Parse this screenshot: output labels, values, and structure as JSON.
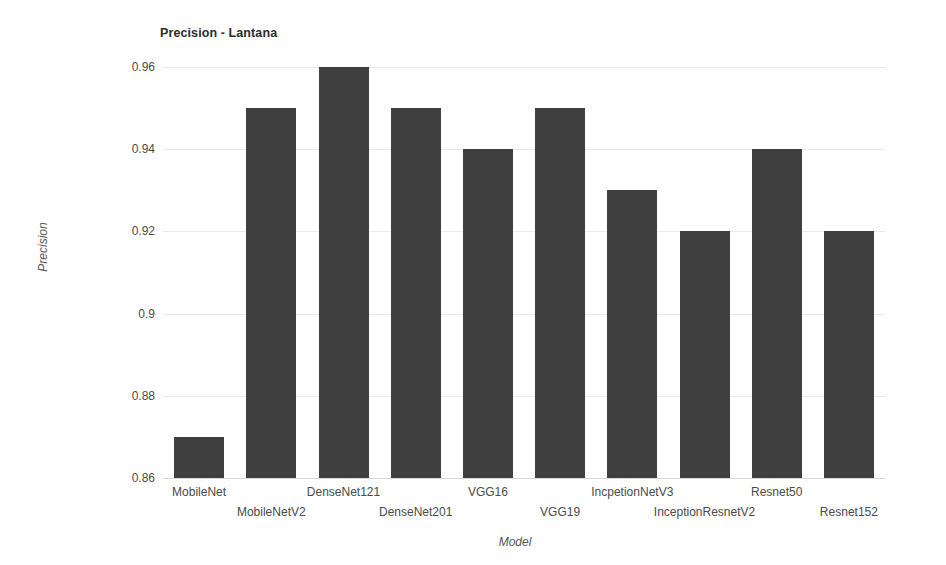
{
  "chart_data": {
    "type": "bar",
    "title": "Precision - Lantana",
    "xlabel": "Model",
    "ylabel": "Precision",
    "categories": [
      "MobileNet",
      "MobileNetV2",
      "DenseNet121",
      "DenseNet201",
      "VGG16",
      "VGG19",
      "IncpetionNetV3",
      "InceptionResnetV2",
      "Resnet50",
      "Resnet152"
    ],
    "values": [
      0.87,
      0.95,
      0.96,
      0.95,
      0.94,
      0.95,
      0.93,
      0.92,
      0.94,
      0.92
    ],
    "ylim": [
      0.86,
      0.96
    ],
    "yticks": [
      "0.86",
      "0.88",
      "0.9",
      "0.92",
      "0.94",
      "0.96"
    ],
    "ytick_values": [
      0.86,
      0.88,
      0.9,
      0.92,
      0.94,
      0.96
    ],
    "grid": true,
    "legend": false,
    "bar_color": "#3f3f3f",
    "grid_color": "#e9e9e9",
    "background": "#ffffff"
  }
}
